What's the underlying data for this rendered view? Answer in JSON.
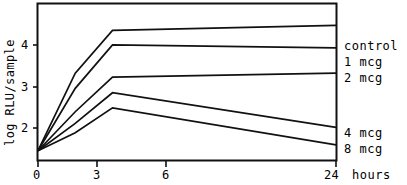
{
  "chart_data": {
    "type": "line",
    "title": "",
    "subtitle": "",
    "xlabel": "",
    "ylabel": "log RLU/sample",
    "x_units_label": "24 hours",
    "x": [
      0,
      3,
      6,
      24
    ],
    "x_tick_labels": [
      "0",
      "3",
      "6",
      "24"
    ],
    "y_tick_labels": [
      "2",
      "3",
      "4"
    ],
    "y_ticks": [
      2,
      3,
      4
    ],
    "xlim": [
      0,
      24
    ],
    "ylim": [
      1.22,
      4.42
    ],
    "grid": false,
    "legend_position": "right-of-axes",
    "annotations": [],
    "series": [
      {
        "name": "control",
        "values": [
          1.41,
          3.0,
          3.88,
          3.98
        ]
      },
      {
        "name": "1 mcg",
        "values": [
          1.41,
          2.69,
          3.58,
          3.52
        ]
      },
      {
        "name": "2 mcg",
        "values": [
          1.41,
          2.21,
          2.92,
          3.0
        ]
      },
      {
        "name": "4 mcg",
        "values": [
          1.41,
          1.97,
          2.6,
          1.89
        ]
      },
      {
        "name": "8 mcg",
        "values": [
          1.41,
          1.78,
          2.29,
          1.53
        ]
      }
    ]
  },
  "axes": {
    "y_title": "log RLU/sample",
    "x_tick_0": "0",
    "x_tick_3": "3",
    "x_tick_6": "6",
    "x_tick_24": "24",
    "x_units": "hours",
    "y_tick_2": "2",
    "y_tick_3": "3",
    "y_tick_4": "4"
  },
  "legend": {
    "items": [
      {
        "label": "control"
      },
      {
        "label": "1 mcg"
      },
      {
        "label": "2 mcg"
      },
      {
        "label": "4 mcg"
      },
      {
        "label": "8 mcg"
      }
    ]
  },
  "style": {
    "line_color": "#111111",
    "axis_color": "#111111",
    "background": "#ffffff"
  }
}
